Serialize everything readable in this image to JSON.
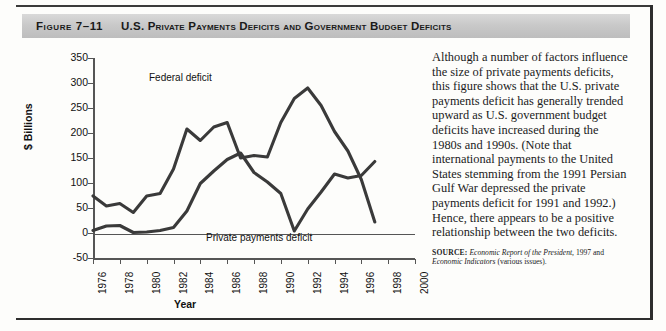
{
  "figure": {
    "number": "Figure 7–11",
    "title": "U.S. Private Payments Deficits and Government Budget Deficits"
  },
  "chart_data": {
    "type": "line",
    "title": "U.S. Private Payments Deficits and Government Budget Deficits",
    "xlabel": "Year",
    "ylabel": "$ Billions",
    "xlim": [
      1976,
      2000
    ],
    "ylim": [
      -50,
      350
    ],
    "ytick_labels": [
      "350",
      "300",
      "250",
      "200",
      "150",
      "100",
      "50",
      "0",
      "-50"
    ],
    "yticks": [
      350,
      300,
      250,
      200,
      150,
      100,
      50,
      0,
      -50
    ],
    "xtick_labels": [
      "1976",
      "1978",
      "1980",
      "1982",
      "1984",
      "1986",
      "1988",
      "1990",
      "1992",
      "1994",
      "1996",
      "1998",
      "2000"
    ],
    "xticks": [
      1976,
      1978,
      1980,
      1982,
      1984,
      1986,
      1988,
      1990,
      1992,
      1994,
      1996,
      1998,
      2000
    ],
    "grid": false,
    "legend_position": "inline-annotations",
    "x": [
      1976,
      1977,
      1978,
      1979,
      1980,
      1981,
      1982,
      1983,
      1984,
      1985,
      1986,
      1987,
      1988,
      1989,
      1990,
      1991,
      1992,
      1993,
      1994,
      1995,
      1996,
      1997
    ],
    "series": [
      {
        "name": "Federal deficit",
        "color": "#3a3a3a",
        "values": [
          74,
          54,
          59,
          41,
          74,
          79,
          128,
          208,
          185,
          212,
          221,
          150,
          155,
          152,
          221,
          269,
          290,
          255,
          203,
          164,
          107,
          22
        ]
      },
      {
        "name": "Private payments deficit",
        "color": "#3a3a3a",
        "values": [
          5,
          14,
          15,
          1,
          2,
          5,
          11,
          44,
          99,
          124,
          147,
          160,
          121,
          102,
          79,
          4,
          48,
          82,
          118,
          110,
          115,
          143
        ]
      }
    ],
    "annotations": [
      {
        "text": "Federal deficit",
        "x": 1983,
        "y": 290
      },
      {
        "text": "Private payments deficit",
        "x": 1992,
        "y": 20
      }
    ]
  },
  "sidebar": {
    "paragraph": "Although a number of factors influence the size of private payments deficits, this figure shows that the U.S. private payments deficit has generally trended upward as U.S. government budget deficits have increased during the 1980s and 1990s. (Note that international payments to the United States stemming from the 1991 Persian Gulf War depressed the private payments deficit for 1991 and 1992.) Hence, there appears to be a positive relationship between the two deficits.",
    "source_label": "SOURCE:",
    "source_italic_1": "Economic Report of the President,",
    "source_mid": " 1997 and ",
    "source_italic_2": "Economic Indicators",
    "source_tail": " (various issues)."
  }
}
